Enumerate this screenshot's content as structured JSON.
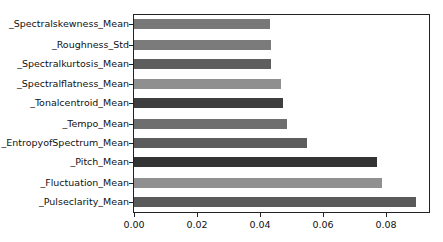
{
  "chart_data": {
    "type": "bar",
    "orientation": "horizontal",
    "title": "",
    "xlabel": "",
    "ylabel": "",
    "xlim": [
      0,
      0.0943
    ],
    "xticks": [
      "0.00",
      "0.02",
      "0.04",
      "0.06",
      "0.08"
    ],
    "grid": false,
    "legend": null,
    "categories": [
      "_Spectralskewness_Mean",
      "_Roughness_Std",
      "_Spectralkurtosis_Mean",
      "_Spectralflatness_Mean",
      "_Tonalcentroid_Mean",
      "_Tempo_Mean",
      "_EntropyofSpectrum_Mean",
      "_Pitch_Mean",
      "_Fluctuation_Mean",
      "_Pulseclarity_Mean"
    ],
    "values": [
      0.0432,
      0.0435,
      0.0435,
      0.0467,
      0.0473,
      0.0486,
      0.0549,
      0.0771,
      0.0787,
      0.0895
    ],
    "colors": [
      "#787878",
      "#7b7b7b",
      "#5e5e5e",
      "#8f8f8f",
      "#3e3e3e",
      "#6e6e6e",
      "#5c5c5c",
      "#333333",
      "#909090",
      "#5a5a5a"
    ]
  }
}
